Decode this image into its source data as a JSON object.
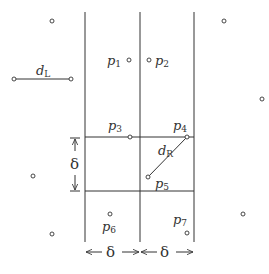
{
  "diagram": {
    "title": "",
    "colors": {
      "stroke": "#333333",
      "background": "#ffffff"
    },
    "grid": {
      "vertical_lines_x": [
        85,
        140,
        194
      ],
      "vertical_y_range": [
        12,
        242
      ],
      "horizontal_lines_y": [
        137,
        191
      ]
    },
    "labels": {
      "p1": {
        "base": "p",
        "sub": "1"
      },
      "p2": {
        "base": "p",
        "sub": "2"
      },
      "p3": {
        "base": "p",
        "sub": "3"
      },
      "p4": {
        "base": "p",
        "sub": "4"
      },
      "p5": {
        "base": "p",
        "sub": "5"
      },
      "p6": {
        "base": "p",
        "sub": "6"
      },
      "p7": {
        "base": "p",
        "sub": "7"
      },
      "dL": {
        "base": "d",
        "sub": "L"
      },
      "dR": {
        "base": "d",
        "sub": "R"
      },
      "delta_vertical": "δ",
      "delta_left": "δ",
      "delta_right": "δ"
    },
    "points": [
      {
        "name": "p1",
        "x": 129,
        "y": 60
      },
      {
        "name": "p2",
        "x": 149,
        "y": 60
      },
      {
        "name": "p3",
        "x": 130,
        "y": 137
      },
      {
        "name": "p4",
        "x": 187,
        "y": 137
      },
      {
        "name": "p5",
        "x": 148,
        "y": 177
      },
      {
        "name": "p6",
        "x": 110,
        "y": 214
      },
      {
        "name": "p7",
        "x": 187,
        "y": 233
      },
      {
        "name": "outer-1",
        "x": 52,
        "y": 21
      },
      {
        "name": "outer-2",
        "x": 224,
        "y": 21
      },
      {
        "name": "outer-3",
        "x": 262,
        "y": 99
      },
      {
        "name": "outer-4",
        "x": 33,
        "y": 176
      },
      {
        "name": "outer-5",
        "x": 243,
        "y": 214
      },
      {
        "name": "outer-6",
        "x": 52,
        "y": 234
      },
      {
        "name": "dL-start",
        "x": 14,
        "y": 79
      },
      {
        "name": "dL-end",
        "x": 71,
        "y": 79
      }
    ],
    "segments": [
      {
        "name": "dL",
        "from": [
          14,
          79
        ],
        "to": [
          71,
          79
        ]
      },
      {
        "name": "dR",
        "from": [
          148,
          177
        ],
        "to": [
          187,
          137
        ]
      }
    ]
  }
}
